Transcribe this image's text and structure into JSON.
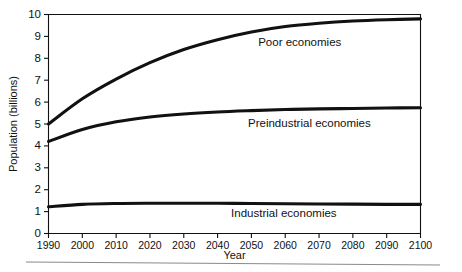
{
  "chart_data": {
    "type": "line",
    "title": "",
    "xlabel": "Year",
    "ylabel": "Population (billions)",
    "xlim": [
      1990,
      2100
    ],
    "ylim": [
      0,
      10
    ],
    "grid": false,
    "legend_position": "inline-right-of-curve",
    "x_ticks": [
      1990,
      2000,
      2010,
      2020,
      2030,
      2040,
      2050,
      2060,
      2070,
      2080,
      2090,
      2100
    ],
    "x_tick_labels": [
      "1990",
      "2000",
      "2010",
      "2020",
      "2030",
      "2040",
      "2050",
      "2060",
      "2070",
      "2080",
      "2090",
      "2100"
    ],
    "y_ticks": [
      0,
      1,
      2,
      3,
      4,
      5,
      6,
      7,
      8,
      9,
      10
    ],
    "y_tick_labels": [
      "0",
      "1",
      "2",
      "3",
      "4",
      "5",
      "6",
      "7",
      "8",
      "9",
      "10"
    ],
    "x": [
      1990,
      2000,
      2010,
      2020,
      2030,
      2040,
      2050,
      2060,
      2070,
      2080,
      2090,
      2100
    ],
    "series": [
      {
        "name": "Poor economies",
        "label": "Poor economies",
        "color": "#111111",
        "values": [
          5.0,
          6.15,
          7.05,
          7.8,
          8.4,
          8.85,
          9.2,
          9.45,
          9.6,
          9.7,
          9.76,
          9.8
        ],
        "label_x": 2052,
        "label_y": 8.72
      },
      {
        "name": "Preindustrial economies",
        "label": "Preindustrial economies",
        "color": "#111111",
        "values": [
          4.2,
          4.75,
          5.1,
          5.32,
          5.46,
          5.55,
          5.61,
          5.66,
          5.69,
          5.71,
          5.73,
          5.74
        ],
        "label_x": 2049,
        "label_y": 5.0
      },
      {
        "name": "Industrial economies",
        "label": "Industrial economies",
        "color": "#111111",
        "values": [
          1.22,
          1.33,
          1.37,
          1.38,
          1.38,
          1.38,
          1.37,
          1.36,
          1.35,
          1.34,
          1.33,
          1.33
        ],
        "label_x": 2044,
        "label_y": 0.9
      }
    ]
  }
}
